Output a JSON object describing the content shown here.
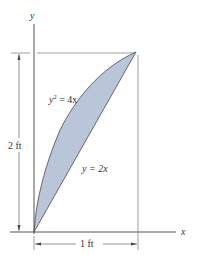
{
  "figure": {
    "axes": {
      "x_label": "x",
      "y_label": "y"
    },
    "curves": [
      {
        "name": "parabola",
        "equation_base": "y",
        "equation_exp": "2",
        "equation_rest": " = 4x"
      },
      {
        "name": "line",
        "equation": "y = 2x"
      }
    ],
    "dimensions": {
      "height_label": "2 ft",
      "width_label": "1 ft"
    },
    "colors": {
      "fill": "#b9c5d8",
      "outline": "#4a4a4a",
      "axis": "#555555"
    }
  }
}
